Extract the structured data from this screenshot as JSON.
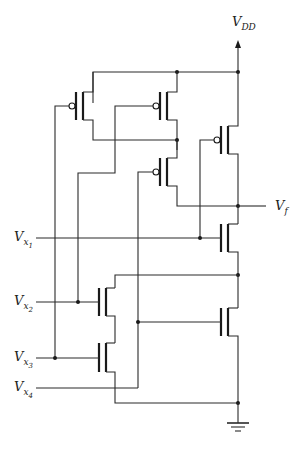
{
  "diagram": {
    "type": "CMOS logic gate schematic",
    "labels": {
      "vdd_main": "V",
      "vdd_sub": "DD",
      "vf_main": "V",
      "vf_sub": "f",
      "x1_main": "V",
      "x1_sub": "x",
      "x1_subsub": "1",
      "x2_main": "V",
      "x2_sub": "x",
      "x2_subsub": "2",
      "x3_main": "V",
      "x3_sub": "x",
      "x3_subsub": "3",
      "x4_main": "V",
      "x4_sub": "x",
      "x4_subsub": "4"
    },
    "components": {
      "pmos": [
        "PMOS (Vx3)",
        "PMOS (Vx2)",
        "PMOS (Vx4)",
        "PMOS output (Vx1 node)"
      ],
      "nmos": [
        "NMOS (Vx1 output pull-down)",
        "NMOS (Vx2)",
        "NMOS (Vx3)",
        "NMOS (Vx4)"
      ],
      "supply": "VDD",
      "ground": "ground"
    },
    "colors": {
      "wire": "#2a2a2a",
      "background": "#ffffff"
    }
  }
}
